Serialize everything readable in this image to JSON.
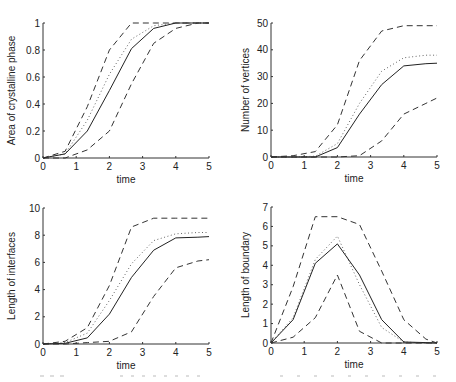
{
  "chart_data": [
    {
      "type": "line",
      "title": "",
      "xlabel": "time",
      "ylabel": "Area of crystalline phase",
      "xlim": [
        0,
        5
      ],
      "ylim": [
        0,
        1
      ],
      "xticks": [
        "0",
        "1",
        "2",
        "3",
        "4",
        "5"
      ],
      "yticks": [
        "0",
        "0.2",
        "0.4",
        "0.6",
        "0.8",
        "1"
      ],
      "ytick_values": [
        0,
        0.2,
        0.4,
        0.6,
        0.8,
        1
      ],
      "grid": false,
      "x": [
        0,
        0.667,
        1.333,
        2,
        2.667,
        3.333,
        4,
        4.667,
        5
      ],
      "series": [
        {
          "name": "upper",
          "style": "dashed",
          "values": [
            0,
            0.05,
            0.38,
            0.8,
            1,
            1,
            1,
            1,
            1
          ]
        },
        {
          "name": "mean",
          "style": "dotted",
          "values": [
            0,
            0.03,
            0.28,
            0.62,
            0.88,
            0.98,
            1,
            1,
            1
          ]
        },
        {
          "name": "median",
          "style": "solid",
          "values": [
            0,
            0.03,
            0.2,
            0.5,
            0.81,
            0.96,
            1,
            1,
            1
          ]
        },
        {
          "name": "lower",
          "style": "dashed",
          "values": [
            0,
            0,
            0.06,
            0.2,
            0.55,
            0.85,
            0.96,
            1,
            1
          ]
        }
      ]
    },
    {
      "type": "line",
      "title": "",
      "xlabel": "time",
      "ylabel": "Number of vertices",
      "xlim": [
        0,
        5
      ],
      "ylim": [
        0,
        50
      ],
      "xticks": [
        "0",
        "1",
        "2",
        "3",
        "4",
        "5"
      ],
      "yticks": [
        "0",
        "10",
        "20",
        "30",
        "40",
        "50"
      ],
      "ytick_values": [
        0,
        10,
        20,
        30,
        40,
        50
      ],
      "grid": false,
      "x": [
        0,
        0.667,
        1.333,
        2,
        2.667,
        3.333,
        4,
        4.667,
        5
      ],
      "series": [
        {
          "name": "upper",
          "style": "dashed",
          "values": [
            0,
            0.5,
            2,
            12,
            36,
            47,
            49,
            49,
            49
          ]
        },
        {
          "name": "mean",
          "style": "dotted",
          "values": [
            0,
            0,
            0.3,
            5,
            20,
            32,
            37,
            38,
            38
          ]
        },
        {
          "name": "median",
          "style": "solid",
          "values": [
            0,
            0,
            0,
            3.5,
            16,
            27,
            34,
            34.8,
            35
          ]
        },
        {
          "name": "lower",
          "style": "dashed",
          "values": [
            0,
            0,
            0,
            0,
            0.5,
            6,
            16,
            20,
            22
          ]
        }
      ]
    },
    {
      "type": "line",
      "title": "",
      "xlabel": "time",
      "ylabel": "Length of interfaces",
      "xlim": [
        0,
        5
      ],
      "ylim": [
        0,
        10
      ],
      "xticks": [
        "0",
        "1",
        "2",
        "3",
        "4",
        "5"
      ],
      "yticks": [
        "0",
        "2",
        "4",
        "6",
        "8",
        "10"
      ],
      "ytick_values": [
        0,
        2,
        4,
        6,
        8,
        10
      ],
      "grid": false,
      "x": [
        0,
        0.667,
        1.333,
        2,
        2.667,
        3.333,
        4,
        4.667,
        5
      ],
      "series": [
        {
          "name": "upper",
          "style": "dashed",
          "values": [
            0,
            0.2,
            1.2,
            4.3,
            8.6,
            9.25,
            9.25,
            9.25,
            9.25
          ]
        },
        {
          "name": "mean",
          "style": "dotted",
          "values": [
            0,
            0.1,
            0.8,
            3.2,
            5.9,
            7.6,
            8.1,
            8.2,
            8.2
          ]
        },
        {
          "name": "median",
          "style": "solid",
          "values": [
            0,
            0.05,
            0.45,
            2.2,
            4.9,
            6.9,
            7.8,
            7.85,
            7.9
          ]
        },
        {
          "name": "lower",
          "style": "dashed",
          "values": [
            0,
            0,
            0.1,
            0.2,
            0.9,
            3.5,
            5.6,
            6.1,
            6.2
          ]
        }
      ]
    },
    {
      "type": "line",
      "title": "",
      "xlabel": "time",
      "ylabel": "Length of boundary",
      "xlim": [
        0,
        5
      ],
      "ylim": [
        0,
        7
      ],
      "xticks": [
        "0",
        "1",
        "2",
        "3",
        "4",
        "5"
      ],
      "yticks": [
        "0",
        "1",
        "2",
        "3",
        "4",
        "5",
        "6",
        "7"
      ],
      "ytick_values": [
        0,
        1,
        2,
        3,
        4,
        5,
        6,
        7
      ],
      "grid": false,
      "x": [
        0,
        0.667,
        1.333,
        2,
        2.667,
        3.333,
        4,
        4.667,
        5
      ],
      "series": [
        {
          "name": "upper",
          "style": "dashed",
          "values": [
            0,
            2.9,
            6.5,
            6.5,
            6.1,
            3.7,
            1.2,
            0.2,
            0
          ]
        },
        {
          "name": "mean",
          "style": "dotted",
          "values": [
            0,
            1.3,
            4.3,
            5.5,
            3.0,
            0.8,
            0.05,
            0,
            0
          ]
        },
        {
          "name": "median",
          "style": "solid",
          "values": [
            0,
            1.2,
            4.1,
            5.1,
            3.5,
            1.2,
            0.05,
            0.02,
            0
          ]
        },
        {
          "name": "lower",
          "style": "dashed",
          "values": [
            0,
            0.3,
            1.3,
            3.5,
            0.6,
            0,
            0,
            0,
            0
          ]
        }
      ]
    }
  ]
}
